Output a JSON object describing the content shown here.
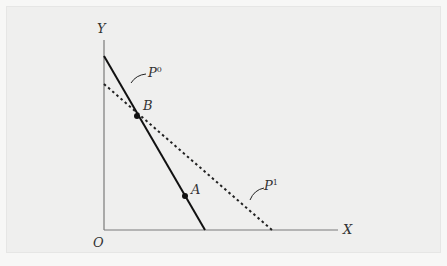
{
  "diagram": {
    "axes": {
      "y_label": "Y",
      "x_label": "X",
      "origin_label": "O"
    },
    "lines": [
      {
        "name": "P",
        "superscript": "0",
        "style": "solid",
        "from": [
          104,
          56
        ],
        "to": [
          205,
          230
        ]
      },
      {
        "name": "P",
        "superscript": "1",
        "style": "dotted",
        "from": [
          104,
          84
        ],
        "to": [
          272,
          230
        ]
      }
    ],
    "points": [
      {
        "label": "B",
        "x": 137,
        "y": 116
      },
      {
        "label": "A",
        "x": 185,
        "y": 196
      }
    ],
    "colors": {
      "background": "#efefee",
      "axis": "#777777",
      "line": "#111111"
    }
  }
}
